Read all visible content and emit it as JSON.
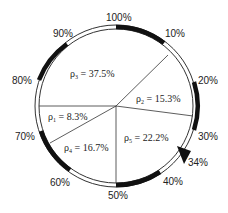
{
  "diagram": {
    "type": "circular-progress-pie",
    "ring_labels": [
      {
        "text": "100%",
        "angle": 0
      },
      {
        "text": "10%",
        "angle": 36
      },
      {
        "text": "20%",
        "angle": 72
      },
      {
        "text": "30%",
        "angle": 108
      },
      {
        "text": "34%",
        "angle": 122
      },
      {
        "text": "40%",
        "angle": 144
      },
      {
        "text": "50%",
        "angle": 180
      },
      {
        "text": "60%",
        "angle": 216
      },
      {
        "text": "70%",
        "angle": 252
      },
      {
        "text": "80%",
        "angle": 288
      },
      {
        "text": "90%",
        "angle": 324
      }
    ],
    "sectors": [
      {
        "symbol": "ρ",
        "sub": "3",
        "value": "37.5%"
      },
      {
        "symbol": "ρ",
        "sub": "2",
        "value": "15.3%"
      },
      {
        "symbol": "ρ",
        "sub": "1",
        "value": "8.3%"
      },
      {
        "symbol": "ρ",
        "sub": "4",
        "value": "16.7%"
      },
      {
        "symbol": "ρ",
        "sub": "5",
        "value": "22.2%"
      }
    ],
    "pointer": {
      "label": "34%",
      "shape": "triangle"
    },
    "colors": {
      "ring_fill": "#ffffff",
      "ring_dark": "#111111",
      "line": "#333333"
    }
  }
}
